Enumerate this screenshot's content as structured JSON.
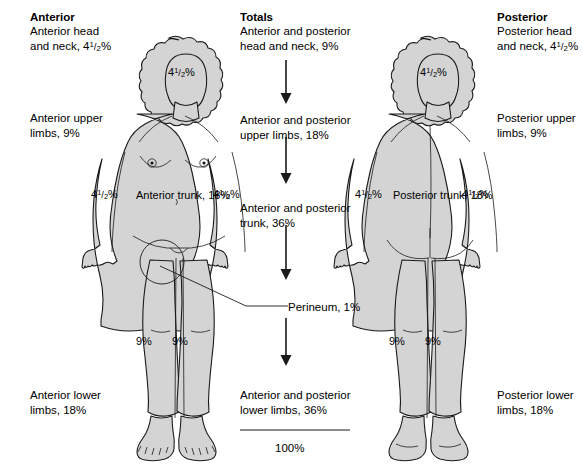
{
  "columns": {
    "anterior": {
      "heading": "Anterior",
      "items": [
        "Anterior head\nand neck, 4½%",
        "Anterior upper\nlimbs, 9%",
        "Anterior lower\nlimbs, 18%"
      ]
    },
    "totals": {
      "heading": "Totals",
      "items": [
        "Anterior and posterior\nhead and neck, 9%",
        "Anterior and posterior\nupper limbs, 18%",
        "Anterior and posterior\ntrunk, 36%",
        "Perineum, 1%",
        "Anterior and posterior\nlower limbs, 36%"
      ],
      "grand_total": "100%"
    },
    "posterior": {
      "heading": "Posterior",
      "items": [
        "Posterior head\nand neck, 4½%",
        "Posterior upper\nlimbs, 9%",
        "Posterior lower\nlimbs, 18%"
      ]
    }
  },
  "figures": {
    "anterior_figure": {
      "name": "anterior body figure",
      "labels": {
        "head": "4½%",
        "arm_left": "4½%",
        "arm_right": "4½%",
        "trunk": "Anterior\ntrunk, 18%",
        "leg_left": "9%",
        "leg_right": "9%"
      }
    },
    "posterior_figure": {
      "name": "posterior body figure",
      "labels": {
        "head": "4½%",
        "arm_left": "4½%",
        "arm_right": "4½%",
        "trunk": "Posterior\ntrunk, 18%",
        "leg_left": "9%",
        "leg_right": "9%"
      }
    }
  },
  "annotations": {
    "perineum_callout": "Perineum, 1%"
  },
  "colors": {
    "body_fill": "#d4d4d4",
    "outline": "#1a1a1a",
    "background": "#ffffff",
    "text": "#000000"
  }
}
